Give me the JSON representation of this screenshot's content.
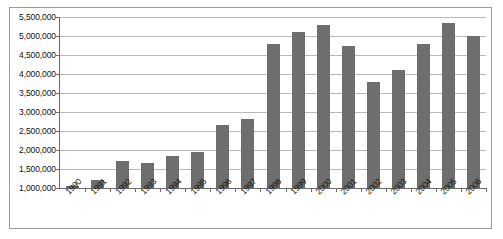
{
  "chart_data": {
    "type": "bar",
    "title": "",
    "subtitle": "",
    "xlabel": "",
    "ylabel": "",
    "categories": [
      "1990",
      "1991",
      "1992",
      "1993",
      "1994",
      "1995",
      "1996",
      "1997",
      "1998",
      "1999",
      "2000",
      "2001",
      "2002",
      "2003",
      "2004",
      "2005",
      "2006"
    ],
    "values": [
      1060000,
      1200000,
      1700000,
      1650000,
      1850000,
      1960000,
      2650000,
      2820000,
      4800000,
      5100000,
      5300000,
      4750000,
      3800000,
      4100000,
      4800000,
      5350000,
      5000000
    ],
    "series": [
      {
        "name": "",
        "values": [
          1060000,
          1200000,
          1700000,
          1650000,
          1850000,
          1960000,
          2650000,
          2820000,
          4800000,
          5100000,
          5300000,
          4750000,
          3800000,
          4100000,
          4800000,
          5350000,
          5000000
        ]
      }
    ],
    "ylim": [
      1000000,
      5500000
    ],
    "ytick_values": [
      1000000,
      1500000,
      2000000,
      2500000,
      3000000,
      3500000,
      4000000,
      4500000,
      5000000,
      5500000
    ],
    "ytick_labels": [
      "1,000,000",
      "1,500,000",
      "2,000,000",
      "2,500,000",
      "3,000,000",
      "3,500,000",
      "4,000,000",
      "4,500,000",
      "5,000,000",
      "5,500,000"
    ],
    "grid": true,
    "legend": false,
    "legend_position": "none",
    "bar_color": "#6e6e6e",
    "grid_color": "#b9b9b9",
    "axis_color": "#6b6b6b",
    "background_color": "#ffffff",
    "xtick_label_rotation": -45
  }
}
